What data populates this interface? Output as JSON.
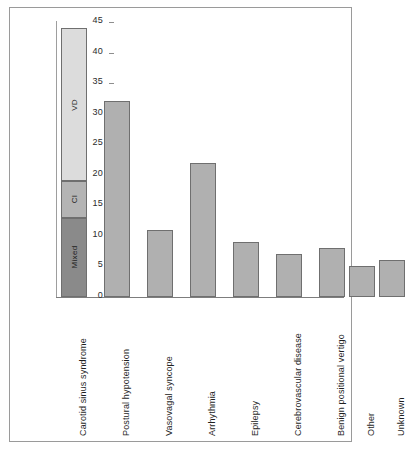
{
  "chart_data": {
    "type": "bar",
    "title": "",
    "subtitle": "",
    "xlabel": "",
    "ylabel": "",
    "ylim": [
      0,
      45
    ],
    "ytick_step": 5,
    "yticks": [
      45,
      40,
      35,
      30,
      25,
      20,
      15,
      10,
      5,
      0
    ],
    "grid": false,
    "legend_position": "in-bar",
    "categories": [
      "Carotid sinus syndrome",
      "Postural hypotension",
      "Vasovagal syncope",
      "Arrhythmia",
      "Epilepsy",
      "Cerebrovascular disease",
      "Benign positional vertigo",
      "Other",
      "Unknown"
    ],
    "values": [
      44,
      32,
      11,
      22,
      9,
      7,
      8,
      5,
      6
    ],
    "stacked_first_bar": {
      "category": "Carotid sinus syndrome",
      "total": 44,
      "segments": [
        {
          "label": "Mixed",
          "from": 0,
          "to": 13,
          "value": 13,
          "color": "#8a8a8a"
        },
        {
          "label": "CI",
          "from": 13,
          "to": 19,
          "value": 6,
          "color": "#b4b4b4"
        },
        {
          "label": "VD",
          "from": 19,
          "to": 44,
          "value": 25,
          "color": "#dcdcdc"
        }
      ]
    },
    "bar_color": "#b0b0b0",
    "bar_border_color": "#6f6f6f",
    "axis_color": "#8e8e8e"
  }
}
